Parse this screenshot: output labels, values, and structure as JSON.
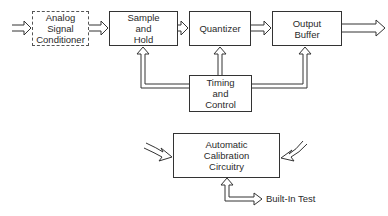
{
  "diagram": {
    "type": "block-diagram",
    "blocks": {
      "signal_conditioner": {
        "line1": "Analog",
        "line2": "Signal",
        "line3": "Conditioner",
        "style": "dashed"
      },
      "sample_hold": {
        "line1": "Sample",
        "line2": "and",
        "line3": "Hold"
      },
      "quantizer": {
        "line1": "Quantizer"
      },
      "output_buffer": {
        "line1": "Output",
        "line2": "Buffer"
      },
      "timing_control": {
        "line1": "Timing",
        "line2": "and",
        "line3": "Control"
      },
      "calibration": {
        "line1": "Automatic",
        "line2": "Calibration",
        "line3": "Circuitry"
      }
    },
    "labels": {
      "built_in_test": "Built-In Test"
    },
    "connections": [
      {
        "from": "input",
        "to": "signal_conditioner",
        "style": "hollow-arrow"
      },
      {
        "from": "signal_conditioner",
        "to": "sample_hold",
        "style": "hollow-arrow"
      },
      {
        "from": "sample_hold",
        "to": "quantizer",
        "style": "hollow-arrow"
      },
      {
        "from": "quantizer",
        "to": "output_buffer",
        "style": "hollow-arrow"
      },
      {
        "from": "output_buffer",
        "to": "output",
        "style": "hollow-arrow"
      },
      {
        "from": "timing_control",
        "to": "sample_hold",
        "style": "hollow-arrow"
      },
      {
        "from": "timing_control",
        "to": "quantizer",
        "style": "hollow-arrow"
      },
      {
        "from": "timing_control",
        "to": "output_buffer",
        "style": "hollow-arrow"
      },
      {
        "from": "left-curved-input",
        "to": "calibration",
        "style": "hollow-curved-arrow"
      },
      {
        "from": "right-curved-input",
        "to": "calibration",
        "style": "hollow-curved-arrow"
      },
      {
        "from": "calibration",
        "to": "built_in_test",
        "style": "bidirectional-hollow-arrow"
      }
    ],
    "colors": {
      "line": "#333333",
      "background": "#ffffff"
    }
  }
}
